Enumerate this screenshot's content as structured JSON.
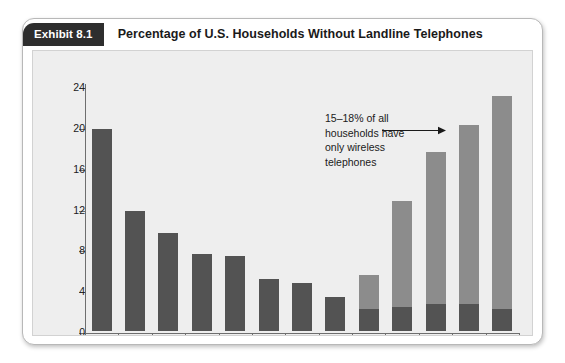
{
  "exhibit": {
    "tag": "Exhibit 8.1",
    "title": "Percentage of U.S. Households Without Landline Telephones"
  },
  "colors": {
    "bar_dark": "#535353",
    "bar_light": "#8c8c8c",
    "panel_background": "#eeeeee",
    "tag_background": "#2e2e2e",
    "axis": "#6e6e6e"
  },
  "annotation": {
    "line1": "15–18% of all",
    "line2": "households have",
    "line3": "only wireless",
    "line4": "telephones"
  },
  "chart_data": {
    "type": "bar",
    "title": "Percentage of U.S. Households Without Landline Telephones",
    "xlabel": "",
    "ylabel": "",
    "ylim": [
      0,
      24
    ],
    "yticks": [
      0,
      4,
      8,
      12,
      16,
      20,
      24
    ],
    "ytick_labels": [
      "0",
      "4",
      "8",
      "12",
      "16",
      "20",
      "24"
    ],
    "grid": false,
    "legend": "none",
    "categories": [
      "1965",
      "1970",
      "1975",
      "1980",
      "1985",
      "1990",
      "1995",
      "2001",
      "2003",
      "2005",
      "2007",
      "2008",
      "2009"
    ],
    "series": [
      {
        "name": "Landline-free (no wireless-only breakout)",
        "color": "#535353",
        "values": [
          19.8,
          11.8,
          9.6,
          7.5,
          7.3,
          5.1,
          4.7,
          3.3,
          2.2,
          2.4,
          2.6,
          2.6,
          2.2
        ]
      },
      {
        "name": "Wireless-only households",
        "color": "#8c8c8c",
        "values": [
          0,
          0,
          0,
          0,
          0,
          0,
          0,
          0,
          3.3,
          10.3,
          14.9,
          17.6,
          20.8
        ]
      }
    ],
    "totals": [
      19.8,
      11.8,
      9.6,
      7.5,
      7.3,
      5.1,
      4.7,
      3.3,
      5.5,
      12.7,
      17.5,
      20.2,
      23.0
    ],
    "annotations": [
      {
        "text": "15–18% of all households have only wireless telephones",
        "points_to": "2007"
      }
    ]
  }
}
